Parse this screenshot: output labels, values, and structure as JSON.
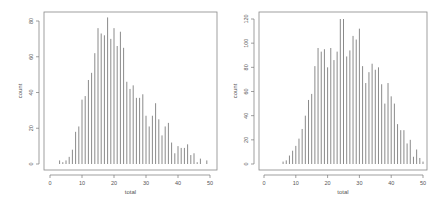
{
  "colors": {
    "bar": "#8a8a8a",
    "axis": "#777777",
    "frame": "#888888",
    "text": "#555555"
  },
  "chart_data": [
    {
      "type": "bar",
      "title": "",
      "xlabel": "total",
      "ylabel": "count",
      "xlim": [
        0,
        50
      ],
      "ylim": [
        0,
        80
      ],
      "xticks": [
        0,
        10,
        20,
        30,
        40,
        50
      ],
      "yticks": [
        0,
        20,
        40,
        60,
        80
      ],
      "grid": false,
      "x": [
        3,
        4,
        5,
        6,
        7,
        8,
        9,
        10,
        11,
        12,
        13,
        14,
        15,
        16,
        17,
        18,
        19,
        20,
        21,
        22,
        23,
        24,
        25,
        26,
        27,
        28,
        29,
        30,
        31,
        32,
        33,
        34,
        35,
        36,
        37,
        38,
        39,
        40,
        41,
        42,
        43,
        44,
        45,
        46,
        47,
        49
      ],
      "values": [
        2,
        1,
        2,
        4,
        8,
        18,
        21,
        36,
        38,
        47,
        51,
        62,
        76,
        73,
        72,
        82,
        70,
        76,
        66,
        74,
        65,
        46,
        42,
        44,
        37,
        37,
        39,
        27,
        21,
        27,
        34,
        25,
        16,
        21,
        23,
        12,
        6,
        10,
        9,
        9,
        11,
        5,
        6,
        1,
        3,
        2
      ]
    },
    {
      "type": "bar",
      "title": "",
      "xlabel": "total",
      "ylabel": "count",
      "xlim": [
        0,
        50
      ],
      "ylim": [
        0,
        120
      ],
      "xticks": [
        0,
        10,
        20,
        30,
        40,
        50
      ],
      "yticks": [
        0,
        20,
        40,
        60,
        80,
        100,
        120
      ],
      "grid": false,
      "x": [
        6,
        7,
        8,
        9,
        10,
        11,
        12,
        13,
        14,
        15,
        16,
        17,
        18,
        19,
        20,
        21,
        22,
        23,
        24,
        25,
        26,
        27,
        28,
        29,
        30,
        31,
        32,
        33,
        34,
        35,
        36,
        37,
        38,
        39,
        40,
        41,
        42,
        43,
        44,
        45,
        46,
        47,
        48,
        49,
        50
      ],
      "values": [
        2,
        3,
        7,
        11,
        15,
        21,
        29,
        40,
        53,
        58,
        81,
        96,
        93,
        95,
        80,
        96,
        86,
        93,
        120,
        120,
        89,
        94,
        106,
        103,
        112,
        81,
        67,
        76,
        83,
        78,
        80,
        66,
        50,
        67,
        56,
        50,
        33,
        28,
        28,
        17,
        20,
        6,
        12,
        5,
        2
      ]
    }
  ],
  "layout": [
    {
      "box": [
        44,
        12,
        217,
        170
      ],
      "x0": 50,
      "x50": 210,
      "y0": 164,
      "ymaxpx": 21
    },
    {
      "box": [
        259,
        12,
        427,
        170
      ],
      "x0": 264,
      "x50": 423,
      "y0": 164,
      "ymaxpx": 19
    }
  ]
}
